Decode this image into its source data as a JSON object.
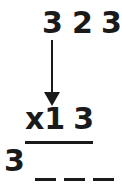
{
  "problem": {
    "top_number": {
      "digits": [
        "3",
        "2",
        "3"
      ]
    },
    "multiplier": {
      "sign": "x",
      "digits": [
        "1",
        "3"
      ]
    },
    "answer": {
      "first_digit": "3",
      "blanks": [
        "_",
        "_",
        "_"
      ]
    }
  },
  "icons": {
    "arrow": "arrow-down-icon"
  },
  "colors": {
    "ink": "#1a1a1a",
    "background": "#ffffff"
  }
}
